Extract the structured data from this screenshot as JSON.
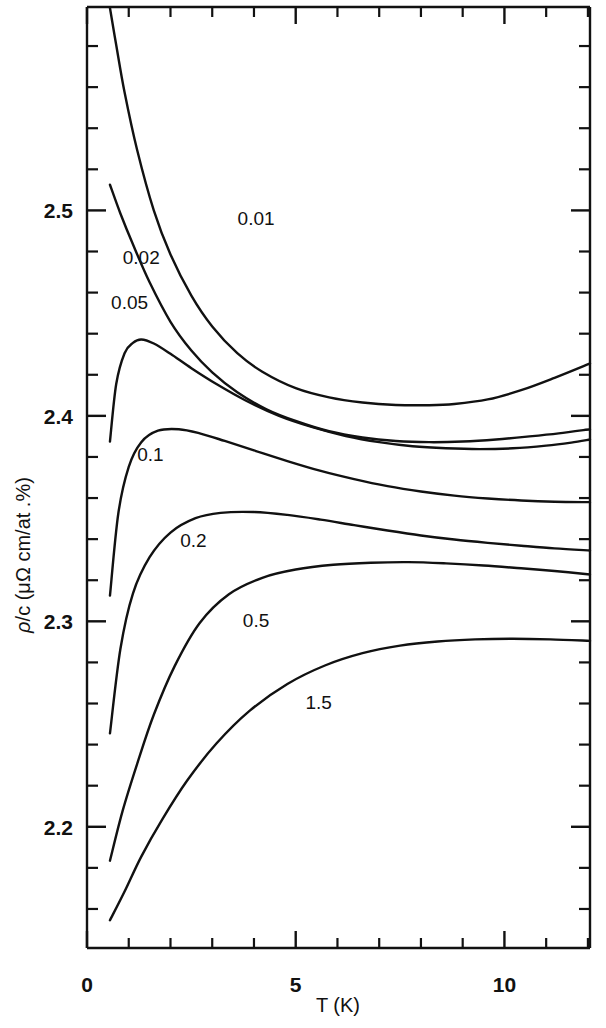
{
  "figure": {
    "name": "resistivity-per-concentration-vs-temperature",
    "background": "#ffffff",
    "ink_color": "#111111"
  },
  "chart_data": {
    "type": "line",
    "title": "",
    "subtitle": "",
    "xlabel": "T (K)",
    "ylabel": "ρ/c (μΩ cm/at .%)",
    "xlim": [
      0,
      12.05
    ],
    "ylim": [
      2.141,
      2.599
    ],
    "grid": false,
    "legend_position": "inline-curve-labels",
    "x_major_ticks": [
      0,
      5,
      10
    ],
    "x_major_tick_labels": [
      "0",
      "5",
      "10"
    ],
    "x_minor_tick_step": 1,
    "y_major_ticks": [
      2.2,
      2.3,
      2.4,
      2.5
    ],
    "y_major_tick_labels": [
      "2.2",
      "2.3",
      "2.4",
      "2.5"
    ],
    "y_minor_tick_step": 0.02,
    "series": [
      {
        "name": "0.01",
        "label": "0.01",
        "label_x": 4.05,
        "label_y": 2.4965,
        "x": [
          0.55,
          0.7,
          0.9,
          1.2,
          1.6,
          2.0,
          2.5,
          3.0,
          3.6,
          4.2,
          5.0,
          5.8,
          6.6,
          7.4,
          8.2,
          8.8,
          9.6,
          10.4,
          11.2,
          12.05
        ],
        "y": [
          2.5985,
          2.5805,
          2.5575,
          2.5295,
          2.5,
          2.4785,
          2.4585,
          2.4435,
          2.4305,
          2.4215,
          2.4135,
          2.409,
          2.4065,
          2.4053,
          2.4052,
          2.4058,
          2.408,
          2.4125,
          2.4185,
          2.4255
        ]
      },
      {
        "name": "0.02",
        "label": "0.02",
        "label_x": 1.3,
        "label_y": 2.4775,
        "x": [
          0.55,
          0.8,
          1.1,
          1.5,
          2.0,
          2.5,
          3.0,
          3.6,
          4.3,
          5.0,
          5.8,
          6.6,
          7.4,
          8.2,
          9.0,
          9.8,
          10.6,
          11.3,
          12.05
        ],
        "y": [
          2.5125,
          2.4985,
          2.4835,
          2.465,
          2.4458,
          2.4318,
          2.4212,
          2.4115,
          2.4032,
          2.3975,
          2.3925,
          2.3895,
          2.3878,
          2.3872,
          2.3875,
          2.3885,
          2.39,
          2.3915,
          2.3935
        ]
      },
      {
        "name": "0.05",
        "label": "0.05",
        "label_x": 1.02,
        "label_y": 2.4555,
        "x": [
          0.55,
          0.7,
          0.9,
          1.1,
          1.3,
          1.6,
          2.0,
          2.5,
          3.1,
          3.8,
          4.6,
          5.4,
          6.2,
          7.0,
          7.8,
          8.6,
          9.4,
          10.2,
          11.0,
          11.6,
          12.05
        ],
        "y": [
          2.3875,
          2.4155,
          2.4305,
          2.4355,
          2.4372,
          2.4352,
          2.4302,
          2.4232,
          2.4155,
          2.4075,
          2.4,
          2.3945,
          2.3902,
          2.3872,
          2.3852,
          2.3842,
          2.3838,
          2.3842,
          2.3855,
          2.387,
          2.3885
        ]
      },
      {
        "name": "0.1",
        "label": "0.1",
        "label_x": 1.52,
        "label_y": 2.3815,
        "x": [
          0.55,
          0.75,
          1.0,
          1.3,
          1.7,
          2.2,
          2.7,
          3.3,
          4.0,
          4.8,
          5.6,
          6.4,
          7.2,
          8.0,
          8.8,
          9.6,
          10.4,
          11.2,
          12.05
        ],
        "y": [
          2.3125,
          2.3525,
          2.3752,
          2.3872,
          2.3928,
          2.3935,
          2.3915,
          2.3878,
          2.3832,
          2.378,
          2.3732,
          2.3692,
          2.3658,
          2.3632,
          2.3612,
          2.3598,
          2.3588,
          2.3582,
          2.358
        ]
      },
      {
        "name": "0.2",
        "label": "0.2",
        "label_x": 2.55,
        "label_y": 2.3395,
        "x": [
          0.55,
          0.8,
          1.1,
          1.5,
          2.0,
          2.6,
          3.2,
          4.0,
          4.8,
          5.6,
          6.4,
          7.2,
          8.0,
          8.8,
          9.6,
          10.4,
          11.2,
          12.05
        ],
        "y": [
          2.2455,
          2.2865,
          2.3135,
          2.3312,
          2.3432,
          2.3502,
          2.3528,
          2.3532,
          2.3518,
          2.3495,
          2.3468,
          2.3442,
          2.3418,
          2.3398,
          2.3382,
          2.3368,
          2.3355,
          2.3345
        ]
      },
      {
        "name": "0.5",
        "label": "0.5",
        "label_x": 4.05,
        "label_y": 2.3005,
        "x": [
          0.55,
          0.85,
          1.2,
          1.6,
          2.1,
          2.7,
          3.4,
          4.2,
          5.0,
          5.9,
          6.8,
          7.7,
          8.6,
          9.5,
          10.4,
          11.2,
          12.05
        ],
        "y": [
          2.1835,
          2.2075,
          2.2305,
          2.2545,
          2.2782,
          2.2992,
          2.3132,
          2.3212,
          2.3252,
          2.3275,
          2.3285,
          2.3288,
          2.3282,
          2.3272,
          2.3258,
          2.3245,
          2.3228
        ]
      },
      {
        "name": "1.5",
        "label": "1.5",
        "label_x": 5.55,
        "label_y": 2.2605,
        "x": [
          0.55,
          0.9,
          1.3,
          1.8,
          2.4,
          3.1,
          3.9,
          4.8,
          5.7,
          6.6,
          7.5,
          8.4,
          9.3,
          10.2,
          11.1,
          12.05
        ],
        "y": [
          2.1545,
          2.1685,
          2.1855,
          2.2035,
          2.2225,
          2.2405,
          2.2565,
          2.2695,
          2.2785,
          2.2845,
          2.2882,
          2.2902,
          2.2912,
          2.2915,
          2.2912,
          2.2905
        ]
      }
    ]
  },
  "axes": {
    "x_title": "T (K)",
    "y_title_parts": {
      "rho": "ρ",
      "slash_c": "/c (",
      "mu_omega": "μΩ",
      "units": " cm/at .%)"
    },
    "y_title_full": "ρ/c (μΩ cm/at .%)"
  }
}
